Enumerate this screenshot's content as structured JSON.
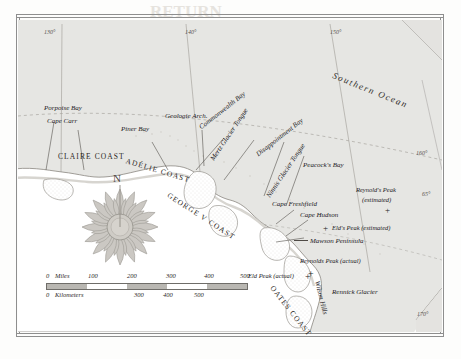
{
  "map": {
    "title": "Antarctic Coast Map",
    "ocean_label": "Southern Ocean",
    "compass": {
      "north_label": "N"
    },
    "graticule": [
      {
        "label": "130°"
      },
      {
        "label": "140°"
      },
      {
        "label": "150°"
      },
      {
        "label": "160°"
      },
      {
        "label": "65°"
      },
      {
        "label": "170°"
      }
    ],
    "coasts": [
      {
        "label": "CLAIRE COAST"
      },
      {
        "label": "ADÉLIE COAST"
      },
      {
        "label": "GEORGE V COAST"
      },
      {
        "label": "OATES COAST"
      }
    ],
    "places": [
      {
        "label": "Porpoise Bay"
      },
      {
        "label": "Cape Carr"
      },
      {
        "label": "Piner Bay"
      },
      {
        "label": "Geologie Arch."
      },
      {
        "label": "Commonwealth Bay"
      },
      {
        "label": "Mertz Glacier Tongue"
      },
      {
        "label": "Ninnis Glacier Tongue"
      },
      {
        "label": "Disappointment Bay"
      },
      {
        "label": "Peacock's Bay"
      },
      {
        "label": "Cape Freshfield"
      },
      {
        "label": "Cape Hudson"
      },
      {
        "label": "Mawson Peninsula"
      },
      {
        "label": "Wilson Hills"
      },
      {
        "label": "Rennick Glacier"
      }
    ],
    "peaks": [
      {
        "label": "Reynold's Peak",
        "qualifier": "(estimated)",
        "marker": "+"
      },
      {
        "label": "Eld's Peak (estimated)",
        "marker": "+"
      },
      {
        "label": "Reynolds Peak (actual)",
        "marker": "+"
      },
      {
        "label": "Eld Peak (actual)",
        "marker": "+"
      }
    ],
    "scale": {
      "miles_label": "Miles",
      "kilometers_label": "Kilometers",
      "miles_ticks": [
        "0",
        "100",
        "200",
        "300",
        "400",
        "500"
      ],
      "km_ticks": [
        "0",
        "300",
        "400",
        "500"
      ]
    }
  },
  "colors": {
    "ocean": "#e4e3e0",
    "land": "#ffffff",
    "ink": "#23211e",
    "rule": "#8e8e8e"
  },
  "bleed_through": [
    {
      "text": "RETURN"
    },
    {
      "text": "the"
    },
    {
      "text": "EXPEDITION"
    },
    {
      "text": "WILKES"
    },
    {
      "text": "of"
    },
    {
      "text": "SOUTH"
    },
    {
      "text": "NOTES"
    }
  ]
}
